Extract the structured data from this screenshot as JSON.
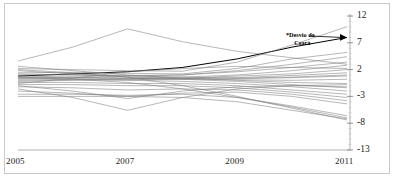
{
  "chart_data": {
    "type": "line",
    "title": "",
    "subtitle": "",
    "xlabel": "",
    "ylabel": "",
    "x": [
      2005,
      2006,
      2007,
      2008,
      2009,
      2010,
      2011
    ],
    "x_tick_labels": [
      "2005",
      "2007",
      "2009",
      "2011"
    ],
    "x_ticks": [
      2005,
      2007,
      2009,
      2011
    ],
    "xlim": [
      2005,
      2011
    ],
    "ylim": [
      -13,
      12
    ],
    "y_ticks": [
      12,
      7,
      2,
      -3,
      -8,
      -13
    ],
    "y_tick_labels": [
      "12",
      "7",
      "2",
      "-3",
      "-8",
      "-13"
    ],
    "grid": false,
    "legend": "none",
    "axis_position": "y-axis on right, x-axis at bottom",
    "line_color": "#7a7a7a",
    "highlight_color": "#000000",
    "annotations": [
      {
        "text_line1": "*Desvio da",
        "text_line2": "Ceará",
        "marker": "arrowhead",
        "points_to_x": 2011,
        "points_to_y": 8.0
      }
    ],
    "series": [
      {
        "name": "Ceará",
        "highlight": true,
        "values": [
          0.8,
          1.2,
          1.6,
          2.4,
          4.0,
          6.2,
          8.0
        ]
      },
      {
        "name": "serie-02",
        "highlight": false,
        "values": [
          3.6,
          6.2,
          9.6,
          7.2,
          5.4,
          4.2,
          3.0
        ]
      },
      {
        "name": "serie-03",
        "highlight": false,
        "values": [
          2.2,
          2.0,
          1.8,
          1.7,
          3.4,
          6.6,
          10.0
        ]
      },
      {
        "name": "serie-04",
        "highlight": false,
        "values": [
          1.4,
          1.5,
          1.3,
          1.2,
          2.2,
          4.0,
          5.2
        ]
      },
      {
        "name": "serie-05",
        "highlight": false,
        "values": [
          1.0,
          1.0,
          0.9,
          1.0,
          1.8,
          3.0,
          4.4
        ]
      },
      {
        "name": "serie-06",
        "highlight": false,
        "values": [
          0.4,
          0.6,
          0.8,
          1.0,
          1.6,
          2.4,
          3.4
        ]
      },
      {
        "name": "serie-07",
        "highlight": false,
        "values": [
          0.6,
          0.5,
          0.4,
          0.6,
          1.0,
          1.8,
          2.8
        ]
      },
      {
        "name": "serie-08",
        "highlight": false,
        "values": [
          0.2,
          0.3,
          0.3,
          0.4,
          0.8,
          1.2,
          2.0
        ]
      },
      {
        "name": "serie-09",
        "highlight": false,
        "values": [
          0.0,
          0.1,
          0.2,
          0.3,
          0.5,
          0.9,
          1.4
        ]
      },
      {
        "name": "serie-10",
        "highlight": false,
        "values": [
          -0.2,
          0.0,
          0.1,
          0.2,
          0.3,
          0.5,
          0.8
        ]
      },
      {
        "name": "serie-11",
        "highlight": false,
        "values": [
          1.8,
          1.2,
          0.6,
          0.3,
          0.1,
          0.0,
          0.2
        ]
      },
      {
        "name": "serie-12",
        "highlight": false,
        "values": [
          2.6,
          1.8,
          1.0,
          0.4,
          0.0,
          -0.4,
          -0.6
        ]
      },
      {
        "name": "serie-13",
        "highlight": false,
        "values": [
          0.8,
          0.6,
          0.4,
          0.2,
          -0.2,
          -0.8,
          -1.4
        ]
      },
      {
        "name": "serie-14",
        "highlight": false,
        "values": [
          0.4,
          0.2,
          0.0,
          -0.2,
          -0.6,
          -1.2,
          -2.0
        ]
      },
      {
        "name": "serie-15",
        "highlight": false,
        "values": [
          -0.4,
          -0.4,
          -0.6,
          -0.6,
          -1.0,
          -1.8,
          -2.6
        ]
      },
      {
        "name": "serie-16",
        "highlight": false,
        "values": [
          -0.8,
          -0.8,
          -1.0,
          -1.0,
          -1.4,
          -2.2,
          -3.2
        ]
      },
      {
        "name": "serie-17",
        "highlight": false,
        "values": [
          -1.2,
          -1.4,
          -1.8,
          -1.6,
          -1.8,
          -2.6,
          -3.8
        ]
      },
      {
        "name": "serie-18",
        "highlight": false,
        "values": [
          -2.0,
          -2.4,
          -3.0,
          -2.4,
          -2.2,
          -3.0,
          -4.4
        ]
      },
      {
        "name": "serie-19",
        "highlight": false,
        "values": [
          -1.0,
          -2.0,
          -3.4,
          -2.0,
          -1.2,
          -1.0,
          -1.2
        ]
      },
      {
        "name": "serie-20",
        "highlight": false,
        "values": [
          -1.6,
          -3.2,
          -5.6,
          -3.2,
          -1.6,
          -1.0,
          -0.8
        ]
      },
      {
        "name": "serie-21",
        "highlight": false,
        "values": [
          -2.6,
          -2.6,
          -2.8,
          -2.6,
          -3.2,
          -4.8,
          -6.6
        ]
      },
      {
        "name": "serie-22",
        "highlight": false,
        "values": [
          -3.0,
          -3.0,
          -3.0,
          -3.2,
          -4.0,
          -5.6,
          -7.2
        ]
      },
      {
        "name": "serie-23",
        "highlight": false,
        "values": [
          0.6,
          0.2,
          -0.4,
          -1.6,
          -3.2,
          -5.0,
          -7.0
        ]
      },
      {
        "name": "serie-24",
        "highlight": false,
        "values": [
          2.0,
          1.4,
          0.6,
          -1.0,
          -3.0,
          -5.2,
          -7.4
        ]
      },
      {
        "name": "serie-25",
        "highlight": false,
        "values": [
          1.2,
          1.0,
          0.8,
          0.6,
          0.4,
          0.6,
          1.0
        ]
      },
      {
        "name": "serie-26",
        "highlight": false,
        "values": [
          -0.6,
          0.4,
          1.6,
          2.2,
          2.6,
          2.4,
          2.2
        ]
      }
    ]
  }
}
